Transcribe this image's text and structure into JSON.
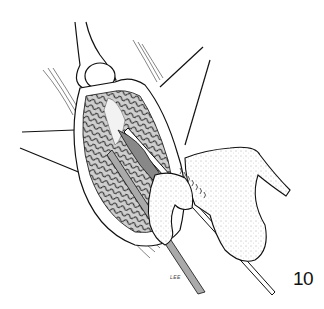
{
  "figure": {
    "number": "10",
    "signature": "LEE",
    "colors": {
      "background": "#ffffff",
      "ink": "#111111",
      "shade": "#555555"
    }
  }
}
